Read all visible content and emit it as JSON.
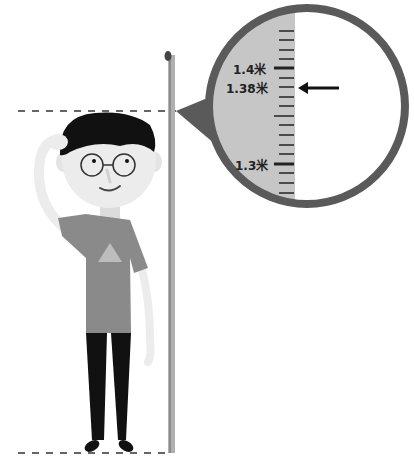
{
  "diagram": {
    "type": "height-measurement-illustration",
    "magnifier": {
      "labels": [
        {
          "id": "mark_1_4",
          "text": "1.4米"
        },
        {
          "id": "mark_1_38",
          "text": "1.38米"
        },
        {
          "id": "mark_1_3",
          "text": "1.3米"
        }
      ],
      "pointer": "arrow-left-icon",
      "reading": "1.38米"
    },
    "colors": {
      "magnifier_border": "#5a5a5a",
      "ruler_fill": "#c4c4c4",
      "shirt": "#8a8a8a",
      "hair": "#111111",
      "pants": "#111111",
      "skin": "#ececec",
      "tape": "#a8a8a8"
    }
  }
}
